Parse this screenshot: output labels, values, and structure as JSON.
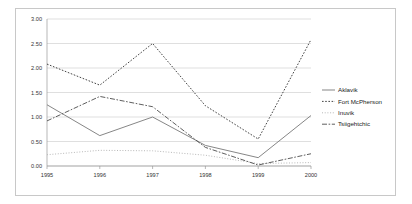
{
  "chart_data": {
    "type": "line",
    "title": "",
    "xlabel": "",
    "ylabel": "",
    "categories": [
      "1995",
      "1996",
      "1997",
      "1998",
      "1999",
      "2000"
    ],
    "ylim": [
      0,
      3
    ],
    "ytick_labels": [
      "0.00",
      "0.50",
      "1.00",
      "1.50",
      "2.00",
      "2.50",
      "3.00"
    ],
    "ytick_values": [
      0,
      0.5,
      1.0,
      1.5,
      2.0,
      2.5,
      3.0
    ],
    "grid": true,
    "legend_position": "right",
    "series": [
      {
        "name": "Aklavik",
        "style": "solid",
        "color": "#808080",
        "values": [
          1.25,
          0.62,
          1.0,
          0.42,
          0.17,
          1.03
        ]
      },
      {
        "name": "Fort McPherson",
        "style": "dotted",
        "color": "#3a3a3a",
        "values": [
          2.08,
          1.65,
          2.5,
          1.23,
          0.55,
          2.58
        ]
      },
      {
        "name": "Inuvik",
        "style": "fine-dot",
        "color": "#b4b4b4",
        "values": [
          0.23,
          0.32,
          0.31,
          0.22,
          0.05,
          0.07
        ]
      },
      {
        "name": "Tsiigehtchic",
        "style": "dash-dot",
        "color": "#555555",
        "values": [
          0.92,
          1.42,
          1.21,
          0.38,
          0.02,
          0.25
        ]
      }
    ]
  },
  "legend": {
    "items": [
      {
        "label": "Aklavik"
      },
      {
        "label": "Fort McPherson"
      },
      {
        "label": "Inuvik"
      },
      {
        "label": "Tsiigehtchic"
      }
    ]
  }
}
